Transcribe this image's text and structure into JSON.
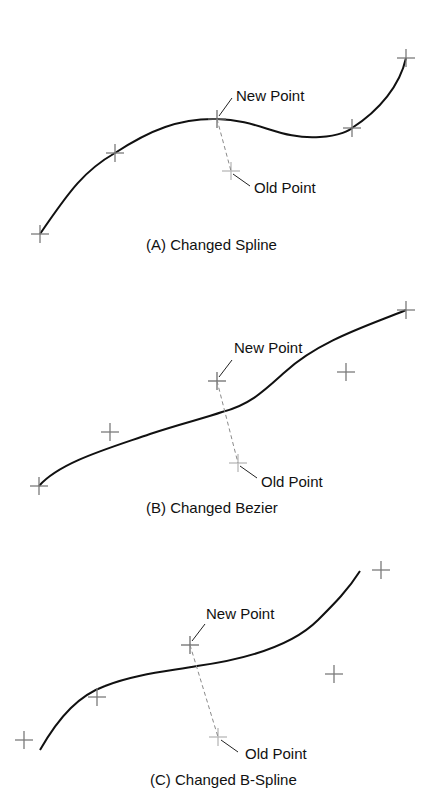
{
  "panels": [
    {
      "id": "A",
      "caption": "(A)  Changed Spline",
      "new_point_label": "New Point",
      "old_point_label": "Old Point",
      "control_points": [
        [
          40,
          234
        ],
        [
          115,
          153
        ],
        [
          217,
          119
        ],
        [
          352,
          128
        ],
        [
          406,
          58
        ]
      ],
      "new_point": [
        217,
        119
      ],
      "old_point": [
        231,
        171
      ]
    },
    {
      "id": "B",
      "caption": "(B)  Changed Bezier",
      "new_point_label": "New Point",
      "old_point_label": "Old Point",
      "control_points": [
        [
          39,
          486
        ],
        [
          110,
          432
        ],
        [
          217,
          381
        ],
        [
          346,
          372
        ],
        [
          406,
          310
        ]
      ],
      "new_point": [
        217,
        381
      ],
      "old_point": [
        238,
        463
      ]
    },
    {
      "id": "C",
      "caption": "(C)  Changed B-Spline",
      "new_point_label": "New Point",
      "old_point_label": "Old Point",
      "control_points": [
        [
          24,
          740
        ],
        [
          97,
          697
        ],
        [
          190,
          645
        ],
        [
          334,
          674
        ],
        [
          381,
          570
        ]
      ],
      "new_point": [
        190,
        645
      ],
      "old_point": [
        218,
        737
      ]
    }
  ],
  "colors": {
    "curve": "#111111",
    "new_point_marker": "#6e6e6e",
    "old_point_marker": "#b8b8b8",
    "dashed_link": "#8a8a8a"
  }
}
